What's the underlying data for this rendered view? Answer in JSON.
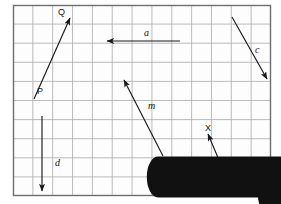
{
  "diagram": {
    "background_color": "#ffffff",
    "grid": {
      "x": 13,
      "y": 5,
      "width": 258,
      "height": 191,
      "columns": 13,
      "rows": 10,
      "line_color": "#b3b3b3",
      "border_color": "#6e6e6e",
      "fill_color": "#fdfdfd"
    },
    "stroke_color": "#1a1a1a",
    "vectors": [
      {
        "id": "pq",
        "name": "vector-p-to-q",
        "from_label": "P",
        "to_label": "Q",
        "x1": 34,
        "y1": 99,
        "x2": 70,
        "y2": 18,
        "arrow_at": "end"
      },
      {
        "id": "a",
        "name": "vector-a",
        "label": "a",
        "x1": 180,
        "y1": 41,
        "x2": 107,
        "y2": 41,
        "arrow_at": "end"
      },
      {
        "id": "c",
        "name": "vector-c",
        "label": "c",
        "x1": 232,
        "y1": 17,
        "x2": 267,
        "y2": 79,
        "arrow_at": "end"
      },
      {
        "id": "m",
        "name": "vector-m",
        "label": "m",
        "x1": 163,
        "y1": 156,
        "x2": 124,
        "y2": 80,
        "arrow_at": "end"
      },
      {
        "id": "d",
        "name": "vector-d",
        "label": "d",
        "x1": 42,
        "y1": 116,
        "x2": 42,
        "y2": 191,
        "arrow_at": "end"
      },
      {
        "id": "wx",
        "name": "vector-w-to-x",
        "from_label": "W",
        "to_label": "X",
        "x1": 232,
        "y1": 191,
        "x2": 208,
        "y2": 134,
        "arrow_at": "end"
      }
    ],
    "labels": [
      {
        "id": "Q",
        "text": "Q",
        "x": 58,
        "y": 8,
        "style": "point"
      },
      {
        "id": "P",
        "text": "P",
        "x": 37,
        "y": 87,
        "style": "point"
      },
      {
        "id": "X",
        "text": "X",
        "x": 205,
        "y": 124,
        "style": "point"
      },
      {
        "id": "W",
        "text": "W",
        "x": 233,
        "y": 184,
        "style": "point"
      },
      {
        "id": "a",
        "text": "a",
        "x": 144,
        "y": 28,
        "style": "vector"
      },
      {
        "id": "c",
        "text": "c",
        "x": 255,
        "y": 45,
        "style": "vector"
      },
      {
        "id": "m",
        "text": "m",
        "x": 148,
        "y": 101,
        "style": "plain"
      },
      {
        "id": "d",
        "text": "d",
        "x": 55,
        "y": 158,
        "style": "plain"
      }
    ]
  }
}
